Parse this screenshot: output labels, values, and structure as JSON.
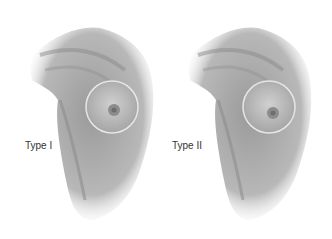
{
  "panels": [
    {
      "label": "Type I"
    },
    {
      "label": "Type II"
    }
  ],
  "colors": {
    "background": "#ffffff",
    "tone_dark": "#7a7a7a",
    "tone_mid": "#a8a8a8",
    "tone_light": "#d8d8d8",
    "label": "#333333"
  }
}
